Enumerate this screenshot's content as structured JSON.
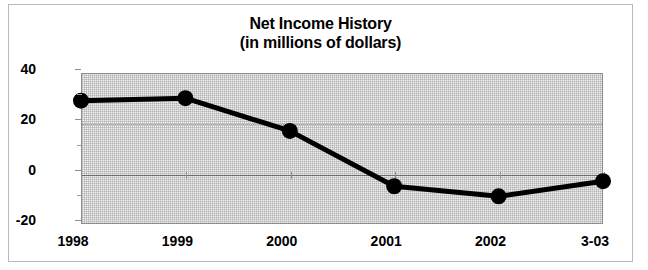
{
  "chart_data": {
    "type": "line",
    "title": "Net Income History",
    "subtitle": "(in millions of dollars)",
    "xlabel": "",
    "ylabel": "",
    "categories": [
      "1998",
      "1999",
      "2000",
      "2001",
      "2002",
      "3-03"
    ],
    "values": [
      29,
      30,
      17,
      -5,
      -9,
      -3
    ],
    "series": [
      {
        "name": "Net Income",
        "values": [
          29,
          30,
          17,
          -5,
          -9,
          -3
        ]
      }
    ],
    "ylim": [
      -20,
      40
    ],
    "ytick_labels": [
      "40",
      "20",
      "0",
      "-20"
    ],
    "ytick_values": [
      40,
      20,
      0,
      -20
    ],
    "yminor_tick_values": [
      30,
      10,
      -10
    ],
    "grid": "horizontal-dotted",
    "zero_line": 0,
    "legend": "none",
    "marker": "filled-circle",
    "line_color": "#000000",
    "marker_color": "#000000",
    "plot_background": "#f0f0f0",
    "frame_color": "#b9b9b9"
  },
  "title_lines": {
    "line1": "Net Income History",
    "line2": "(in millions of dollars)"
  }
}
